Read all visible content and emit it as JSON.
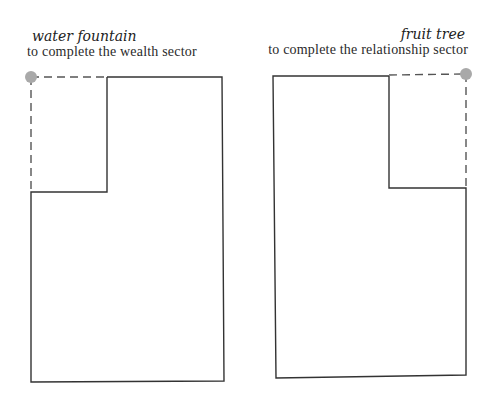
{
  "diagrams": [
    {
      "title": "water fountain",
      "subtitle": "to complete the wealth sector",
      "missing_corner": "top-left"
    },
    {
      "title": "fruit tree",
      "subtitle": "to complete the relationship sector",
      "missing_corner": "top-right"
    }
  ],
  "colors": {
    "outline": "#333333",
    "dashed": "#555555",
    "marker": "#a9a9a9"
  }
}
